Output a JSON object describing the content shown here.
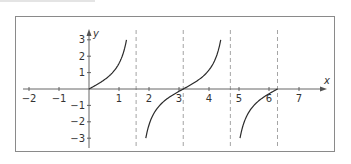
{
  "chart_data": {
    "type": "line",
    "title": "",
    "function": "y = tan(x)",
    "xlabel": "x",
    "ylabel": "y",
    "xlim": [
      -2.2,
      7.9
    ],
    "ylim": [
      -3.5,
      3.5
    ],
    "x_ticks": [
      -2,
      -1,
      1,
      2,
      3,
      4,
      5,
      6,
      7
    ],
    "y_ticks": [
      -3,
      -2,
      -1,
      1,
      2,
      3
    ],
    "grid": false,
    "asymptotes_dashed": [
      1.5708,
      3.1416,
      4.7124,
      6.2832
    ],
    "series": [
      {
        "name": "branch-1",
        "x_range": [
          0,
          1.249
        ],
        "y_range": [
          0,
          3
        ]
      },
      {
        "name": "branch-2",
        "x_range": [
          1.893,
          4.391
        ],
        "y_range": [
          -3,
          3
        ]
      },
      {
        "name": "branch-3",
        "x_range": [
          5.034,
          6.2832
        ],
        "y_range": [
          -3,
          0
        ]
      }
    ],
    "sample_points": [
      {
        "x": 0,
        "y": 0
      },
      {
        "x": 0.785,
        "y": 1
      },
      {
        "x": 1.107,
        "y": 2
      },
      {
        "x": 1.249,
        "y": 3
      },
      {
        "x": 1.893,
        "y": -3
      },
      {
        "x": 2.034,
        "y": -2
      },
      {
        "x": 2.356,
        "y": -1
      },
      {
        "x": 3.1416,
        "y": 0
      },
      {
        "x": 3.927,
        "y": 1
      },
      {
        "x": 4.249,
        "y": 2
      },
      {
        "x": 4.391,
        "y": 3
      },
      {
        "x": 5.034,
        "y": -3
      },
      {
        "x": 5.176,
        "y": -2
      },
      {
        "x": 5.498,
        "y": -1
      },
      {
        "x": 6.2832,
        "y": 0
      }
    ],
    "legend": null
  },
  "layout": {
    "origin_px": [
      89,
      89
    ],
    "x_scale_px": 30,
    "y_scale_px": 16.4,
    "colors": {
      "curve": "#2b2b2b",
      "axis": "#555555",
      "dashed": "#9a9a9a",
      "frame": "#8a8a8a"
    }
  }
}
